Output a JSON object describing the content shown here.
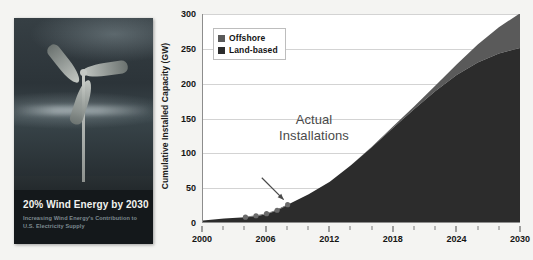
{
  "cover": {
    "title": "20% Wind Energy by 2030",
    "subtitle_line1": "Increasing Wind Energy's Contribution to",
    "subtitle_line2": "U.S. Electricity Supply",
    "image_alt": "wind-turbine-photo"
  },
  "chart_data": {
    "type": "area",
    "title": "",
    "xlabel": "",
    "ylabel": "Cumulative Installed Capacity (GW)",
    "xlim": [
      2000,
      2030
    ],
    "ylim": [
      0,
      300
    ],
    "yticks": [
      0,
      50,
      100,
      150,
      200,
      250,
      300
    ],
    "xticks": [
      2000,
      2006,
      2012,
      2018,
      2024,
      2030
    ],
    "xticks_minor": [
      2002,
      2004,
      2008,
      2010,
      2014,
      2016,
      2020,
      2022,
      2026,
      2028
    ],
    "grid": true,
    "stacked": true,
    "legend_position": "top-left",
    "colors": {
      "offshore": "#5a5a5a",
      "land_based": "#2c2c2c",
      "gridline": "#d3d3d3",
      "axis": "#8d8d8d",
      "plot_background": "#ffffff",
      "page_background": "#f4f4f2",
      "annotation_text": "#4a4a4a"
    },
    "x": [
      2000,
      2002,
      2004,
      2006,
      2008,
      2010,
      2012,
      2014,
      2016,
      2018,
      2020,
      2022,
      2024,
      2026,
      2028,
      2030
    ],
    "series": [
      {
        "name": "Land-based",
        "values": [
          2,
          5,
          7,
          11,
          25,
          40,
          58,
          82,
          108,
          136,
          163,
          189,
          212,
          230,
          243,
          251
        ]
      },
      {
        "name": "Offshore",
        "values": [
          0,
          0,
          0,
          0,
          0,
          0,
          0,
          0,
          1,
          2,
          4,
          8,
          15,
          26,
          38,
          50
        ]
      }
    ],
    "annotations": [
      {
        "text_line1": "Actual",
        "text_line2": "Installations",
        "arrow": true,
        "points_to": "actual-installation-markers"
      }
    ],
    "markers": {
      "name": "Actual Installations",
      "points": [
        {
          "x": 2004,
          "y": 7
        },
        {
          "x": 2005,
          "y": 9
        },
        {
          "x": 2006,
          "y": 12
        },
        {
          "x": 2007,
          "y": 17
        },
        {
          "x": 2008,
          "y": 25
        }
      ]
    },
    "legend": [
      {
        "label": "Offshore",
        "color": "#5a5a5a"
      },
      {
        "label": "Land-based",
        "color": "#2c2c2c"
      }
    ]
  }
}
